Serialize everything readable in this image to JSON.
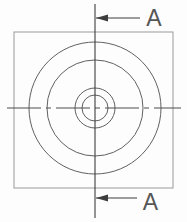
{
  "figure": {
    "type": "engineering-drawing",
    "view": "top-view-with-section-cutting-plane",
    "section_label": "A",
    "colors": {
      "background": "#fdfdfd",
      "outline": "#9a9a9a",
      "circle": "#616161",
      "centerline": "#4c4c4c",
      "section": "#3d3d3d",
      "label": "#565656"
    },
    "square": {
      "x": 14,
      "y": 32,
      "width": 159,
      "height": 156
    },
    "center": {
      "x": 95,
      "y": 108
    },
    "circles": [
      {
        "name": "outer-diameter",
        "r": 66
      },
      {
        "name": "step-diameter",
        "r": 48
      },
      {
        "name": "boss-diameter",
        "r": 20
      },
      {
        "name": "bore-diameter",
        "r": 13
      }
    ],
    "horizontal_centerline": {
      "x1": 7,
      "x2": 181,
      "y": 108
    },
    "vertical_section_line": {
      "x": 95,
      "y1": 4,
      "y2": 218
    },
    "arrows": {
      "top": {
        "tip_x": 96,
        "tail_x": 140,
        "y": 18,
        "head_len": 12,
        "head_half": 3.6,
        "label_x": 154,
        "label_y": 25.5
      },
      "bottom": {
        "tip_x": 96,
        "tail_x": 137,
        "y": 198,
        "head_len": 12,
        "head_half": 3.6,
        "label_x": 150.5,
        "label_y": 210
      }
    }
  }
}
